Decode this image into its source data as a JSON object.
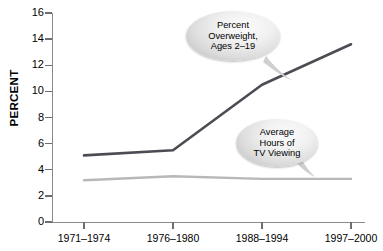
{
  "chart_data": {
    "type": "line",
    "title": "",
    "xlabel": "",
    "ylabel": "PERCENT",
    "ylim": [
      0,
      16
    ],
    "ytick_step": 2,
    "grid": false,
    "legend_position": "inline-callouts",
    "categories": [
      "1971–1974",
      "1976–1980",
      "1988–1994",
      "1997–2000"
    ],
    "series": [
      {
        "name": "Percent Overweight, Ages 2–19",
        "color": "#4c4c54",
        "values": [
          5.1,
          5.5,
          10.5,
          13.6
        ]
      },
      {
        "name": "Average Hours of TV Viewing",
        "color": "#b8b8b8",
        "values": [
          3.2,
          3.5,
          3.3,
          3.3
        ]
      }
    ],
    "annotations": [
      {
        "id": "overweight",
        "lines": [
          "Percent",
          "Overweight,",
          "Ages 2–19"
        ],
        "points_to_series": "Percent Overweight, Ages 2–19"
      },
      {
        "id": "tv",
        "lines": [
          "Average",
          "Hours of",
          "TV Viewing"
        ],
        "points_to_series": "Average Hours of TV Viewing"
      }
    ]
  },
  "axis": {
    "y_ticks": [
      "16",
      "14",
      "12",
      "10",
      "8",
      "6",
      "4",
      "2",
      "0"
    ],
    "y_title": "PERCENT",
    "x_ticks": [
      "1971–1974",
      "1976–1980",
      "1988–1994",
      "1997–2000"
    ]
  },
  "colors": {
    "series_dark": "#4c4c54",
    "series_light": "#b8b8b8",
    "axis": "#8a8a8a",
    "text": "#000000",
    "background": "#ffffff"
  }
}
